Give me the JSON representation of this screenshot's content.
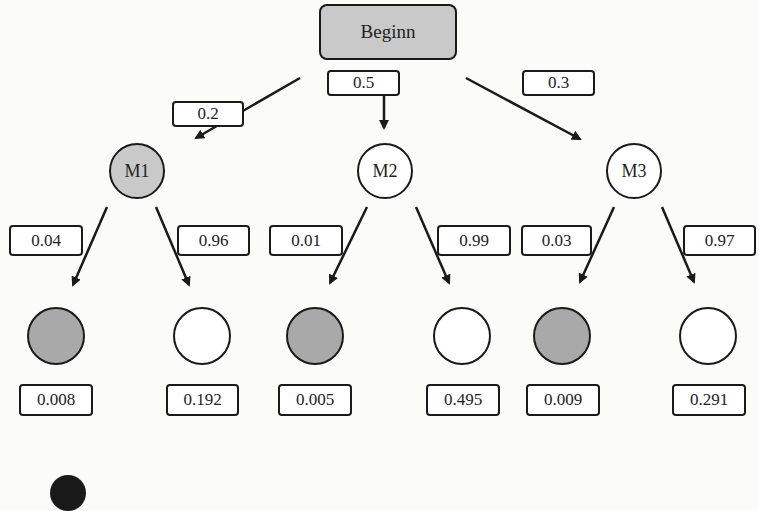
{
  "diagram": {
    "type": "probability-tree",
    "root": {
      "label": "Beginn",
      "fill": "#c9c9c9"
    },
    "level1": [
      {
        "id": "M1",
        "label": "M1",
        "edge_prob": "0.2",
        "fill": "#c9c9c9"
      },
      {
        "id": "M2",
        "label": "M2",
        "edge_prob": "0.5",
        "fill": "#ffffff"
      },
      {
        "id": "M3",
        "label": "M3",
        "edge_prob": "0.3",
        "fill": "#ffffff"
      }
    ],
    "level2": [
      {
        "parent": "M1",
        "edge_prob": "0.04",
        "result": "0.008",
        "fill": "#a9a9a9"
      },
      {
        "parent": "M1",
        "edge_prob": "0.96",
        "result": "0.192",
        "fill": "#ffffff"
      },
      {
        "parent": "M2",
        "edge_prob": "0.01",
        "result": "0.005",
        "fill": "#a9a9a9"
      },
      {
        "parent": "M2",
        "edge_prob": "0.99",
        "result": "0.495",
        "fill": "#ffffff"
      },
      {
        "parent": "M3",
        "edge_prob": "0.03",
        "result": "0.009",
        "fill": "#a9a9a9"
      },
      {
        "parent": "M3",
        "edge_prob": "0.97",
        "result": "0.291",
        "fill": "#ffffff"
      }
    ]
  }
}
